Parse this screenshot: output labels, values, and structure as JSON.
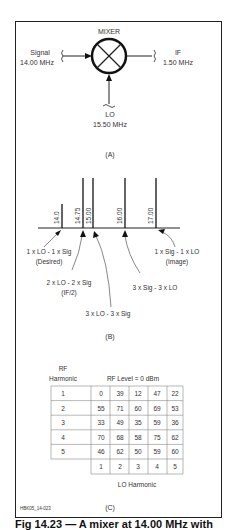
{
  "panel_a": {
    "title": "MIXER",
    "signal_label": "Signal",
    "signal_freq": "14.00 MHz",
    "if_label": "IF",
    "if_freq": "1.50 MHz",
    "lo_label": "LO",
    "lo_freq": "15.50 MHz",
    "tag": "(A)"
  },
  "panel_b": {
    "lines": [
      {
        "label": "14.0",
        "x": 62,
        "height": 24
      },
      {
        "label": "14.75",
        "x": 83,
        "height": 48
      },
      {
        "label": "15.00",
        "x": 93,
        "height": 48
      },
      {
        "label": "16.00",
        "x": 125,
        "height": 48
      },
      {
        "label": "17.00",
        "x": 156,
        "height": 48
      }
    ],
    "annotations": {
      "desired_line1": "1 x LO - 1 x Sig",
      "desired_line2": "(Desired)",
      "if2_line1": "2 x LO - 2 x Sig",
      "if2_line2": "(IF/2)",
      "lo3_line1": "3 x LO - 3 x Sig",
      "sig3": "3 x Sig - 3 x LO",
      "image_line1": "1 x Sig - 1 x LO",
      "image_line2": "(Image)"
    },
    "tag": "(B)"
  },
  "panel_c": {
    "rf_label_line1": "RF",
    "rf_label_line2": "Harmonic",
    "rf_level": "RF Level = 0 dBm",
    "rows": [
      {
        "rf": "1",
        "values": [
          "0",
          "39",
          "12",
          "47",
          "22"
        ]
      },
      {
        "rf": "2",
        "values": [
          "55",
          "71",
          "60",
          "69",
          "53"
        ]
      },
      {
        "rf": "3",
        "values": [
          "33",
          "49",
          "35",
          "59",
          "36"
        ]
      },
      {
        "rf": "4",
        "values": [
          "70",
          "68",
          "58",
          "75",
          "62"
        ]
      },
      {
        "rf": "5",
        "values": [
          "46",
          "62",
          "50",
          "59",
          "60"
        ]
      }
    ],
    "lo_harmonics": [
      "1",
      "2",
      "3",
      "4",
      "5"
    ],
    "lo_label": "LO Harmonic",
    "tag": "(C)"
  },
  "figure_id": "HBK05_14-023",
  "caption": "Fig 14.23 — A mixer at 14.00 MHz with"
}
